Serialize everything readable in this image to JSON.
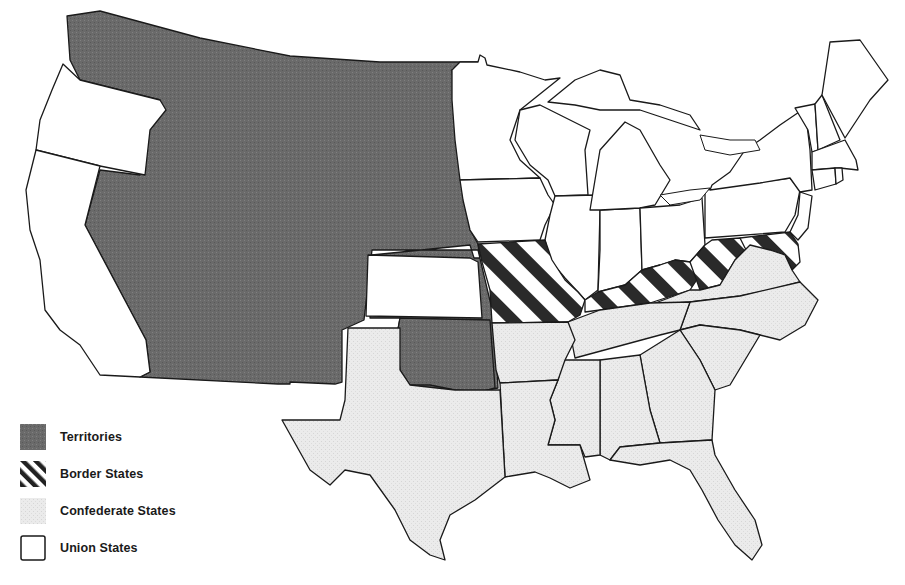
{
  "map": {
    "subject": "United States during the Civil War (1861)",
    "categories": [
      {
        "id": "territories",
        "label": "Territories",
        "color": "#6e6e6e",
        "pattern": "solid-dark-stipple"
      },
      {
        "id": "border",
        "label": "Border States",
        "color": "#2a2a2a",
        "pattern": "diagonal-stripes"
      },
      {
        "id": "confederate",
        "label": "Confederate States",
        "color": "#e6e6e6",
        "pattern": "light-stipple"
      },
      {
        "id": "union",
        "label": "Union States",
        "color": "#ffffff",
        "pattern": "white"
      }
    ],
    "regions": {
      "territories": [
        "Washington Territory",
        "Idaho/Montana",
        "Nevada/Utah",
        "Arizona/New Mexico",
        "Colorado",
        "Dakota",
        "Nebraska",
        "Indian Territory"
      ],
      "border": [
        "Missouri",
        "Kentucky",
        "West Virginia",
        "Maryland",
        "Delaware"
      ],
      "confederate": [
        "Texas",
        "Arkansas",
        "Louisiana",
        "Mississippi",
        "Alabama",
        "Georgia",
        "Florida",
        "South Carolina",
        "North Carolina",
        "Tennessee",
        "Virginia"
      ],
      "union": [
        "Oregon",
        "California",
        "Kansas",
        "Minnesota",
        "Iowa",
        "Wisconsin",
        "Illinois",
        "Indiana",
        "Michigan",
        "Ohio",
        "Pennsylvania",
        "New York",
        "New Jersey",
        "Vermont",
        "New Hampshire",
        "Maine",
        "Massachusetts",
        "Connecticut",
        "Rhode Island"
      ]
    }
  },
  "legend": {
    "items": [
      {
        "label": "Territories"
      },
      {
        "label": "Border States"
      },
      {
        "label": "Confederate States"
      },
      {
        "label": "Union States"
      }
    ]
  }
}
